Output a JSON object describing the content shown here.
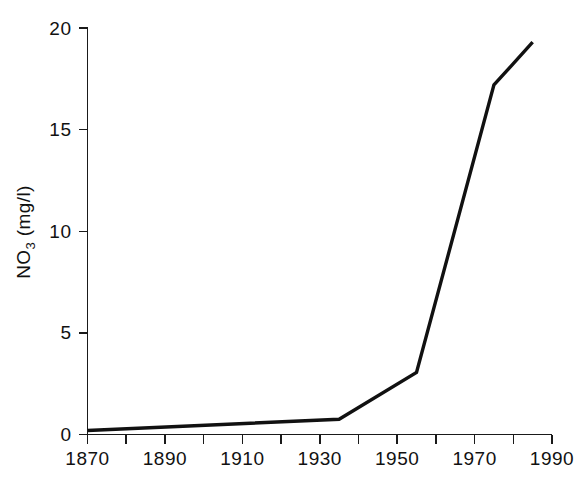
{
  "chart_data": {
    "type": "line",
    "title": "",
    "xlabel": "",
    "ylabel": "NO3 (mg/l)",
    "ylabel_base": "NO",
    "ylabel_sub": "3",
    "ylabel_unit": " (mg/l)",
    "xlim": [
      1870,
      1990
    ],
    "ylim": [
      0,
      20
    ],
    "grid": false,
    "legend": false,
    "x_major_ticks": [
      1870,
      1890,
      1910,
      1930,
      1950,
      1970,
      1990
    ],
    "x_all_ticks": [
      1870,
      1880,
      1890,
      1900,
      1910,
      1920,
      1930,
      1940,
      1950,
      1960,
      1970,
      1980,
      1990
    ],
    "x_tick_labels": [
      "1870",
      "1890",
      "1910",
      "1930",
      "1950",
      "1970",
      "1990"
    ],
    "y_ticks": [
      0,
      5,
      10,
      15,
      20
    ],
    "y_tick_labels": [
      "0",
      "5",
      "10",
      "15",
      "20"
    ],
    "series": [
      {
        "name": "NO3 concentration",
        "color": "#111111",
        "x": [
          1870,
          1935,
          1955,
          1975,
          1985
        ],
        "values": [
          0.2,
          0.75,
          3.05,
          17.2,
          19.3
        ]
      }
    ]
  },
  "figure": {
    "background_color": "#ffffff",
    "axis_color": "#1a1a1a",
    "line_color": "#111111"
  }
}
